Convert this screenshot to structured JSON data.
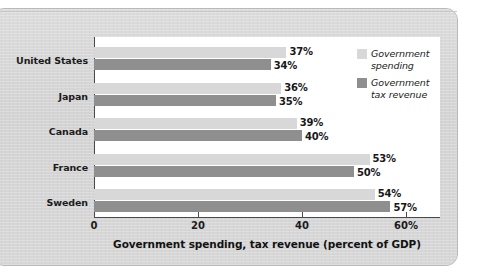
{
  "chart_data": {
    "type": "bar",
    "orientation": "horizontal",
    "title": "",
    "xlabel": "Government spending, tax revenue (percent of GDP)",
    "ylabel": "",
    "xlim": [
      0,
      65
    ],
    "xticks": [
      {
        "value": 0,
        "label": "0"
      },
      {
        "value": 20,
        "label": "20"
      },
      {
        "value": 40,
        "label": "40"
      },
      {
        "value": 60,
        "label": "60%"
      }
    ],
    "grid": false,
    "legend_position": "top-right",
    "categories": [
      "United States",
      "Japan",
      "Canada",
      "France",
      "Sweden"
    ],
    "series": [
      {
        "name": "Government spending",
        "color": "#d8d8d8",
        "values": [
          37,
          36,
          39,
          53,
          54
        ],
        "labels": [
          "37%",
          "36%",
          "39%",
          "53%",
          "54%"
        ]
      },
      {
        "name": "Government tax revenue",
        "color": "#8f8f8f",
        "values": [
          34,
          35,
          40,
          50,
          57
        ],
        "labels": [
          "34%",
          "35%",
          "40%",
          "50%",
          "57%"
        ]
      }
    ]
  },
  "legend": {
    "items": [
      {
        "label_line1": "Government",
        "label_line2": "spending",
        "swatch": "#d8d8d8"
      },
      {
        "label_line1": "Government",
        "label_line2": "tax revenue",
        "swatch": "#8f8f8f"
      }
    ]
  },
  "colors": {
    "page_background": "#d5d5d5",
    "plot_background": "#ffffff",
    "axis": "#4a4a4a",
    "spending_bar": "#d8d8d8",
    "revenue_bar": "#8f8f8f",
    "text": "#1b1b1b"
  }
}
